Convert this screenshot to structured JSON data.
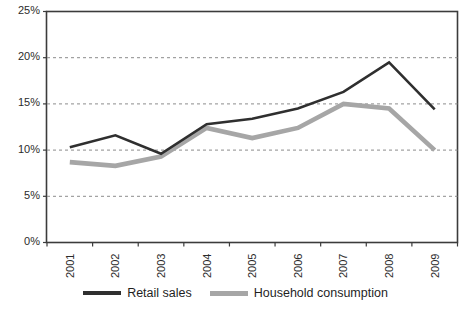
{
  "chart_data": {
    "type": "line",
    "title": "",
    "subtitle": "",
    "xlabel": "",
    "ylabel": "",
    "categories": [
      "2001",
      "2002",
      "2003",
      "2004",
      "2005",
      "2006",
      "2007",
      "2008",
      "2009"
    ],
    "series": [
      {
        "name": "Retail sales",
        "color": "#2f2f2f",
        "values": [
          10.3,
          11.6,
          9.6,
          12.8,
          13.4,
          14.5,
          16.3,
          19.5,
          14.4
        ]
      },
      {
        "name": "Household consumption",
        "color": "#a6a6a6",
        "values": [
          8.7,
          8.3,
          9.3,
          12.4,
          11.3,
          12.4,
          15.0,
          14.5,
          10.0
        ]
      }
    ],
    "ylim": [
      0,
      25
    ],
    "ytick_values": [
      0,
      5,
      10,
      15,
      20,
      25
    ],
    "ytick_labels": [
      "0%",
      "5%",
      "10%",
      "15%",
      "20%",
      "25%"
    ],
    "grid": {
      "horizontal": true,
      "vertical": false,
      "style": "dashed",
      "color": "#8c8c8c"
    },
    "legend": {
      "position": "bottom",
      "entries": [
        "Retail sales",
        "Household consumption"
      ]
    },
    "axis_color": "#3c3c3c",
    "plot_background": "#ffffff"
  }
}
